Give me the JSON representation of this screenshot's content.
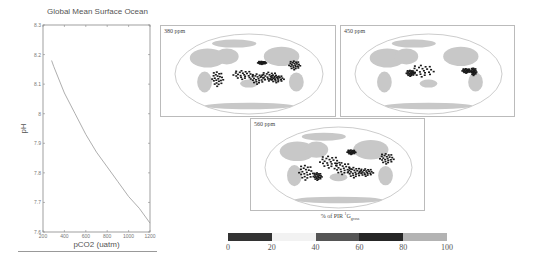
{
  "chart_data": [
    {
      "type": "line",
      "title": "Global Mean Surface Ocean",
      "xlabel": "pCO2 (uatm)",
      "ylabel": "pH",
      "xlim": [
        200,
        1200
      ],
      "ylim": [
        7.6,
        8.3
      ],
      "x_ticks": [
        200,
        400,
        600,
        800,
        1000,
        1200
      ],
      "y_ticks": [
        7.6,
        7.7,
        7.8,
        7.9,
        8,
        8.1,
        8.2,
        8.3
      ],
      "x_tick_labels": [
        "200",
        "400",
        "600",
        "800",
        "1000",
        "1200"
      ],
      "y_tick_labels": [
        "7.6",
        "7.7",
        "7.8",
        "7.9",
        "8",
        "8.1",
        "8.2",
        "8.3"
      ],
      "grid": false,
      "series": [
        {
          "name": "pH",
          "x": [
            280,
            300,
            400,
            500,
            600,
            700,
            800,
            900,
            1000,
            1100,
            1200
          ],
          "y": [
            8.18,
            8.16,
            8.07,
            8.0,
            7.93,
            7.87,
            7.82,
            7.77,
            7.72,
            7.68,
            7.63
          ]
        }
      ]
    },
    {
      "type": "heatmap",
      "title": "% of PIR 1G gross",
      "panels": [
        {
          "label": "380 ppm"
        },
        {
          "label": "450 ppm"
        },
        {
          "label": "560 ppm"
        }
      ],
      "colorbar": {
        "ticks": [
          0,
          20,
          40,
          60,
          80,
          100
        ],
        "bins": [
          {
            "range": [
              0,
              20
            ],
            "color": "#333333"
          },
          {
            "range": [
              20,
              40
            ],
            "color": "#f2f2f2"
          },
          {
            "range": [
              40,
              60
            ],
            "color": "#555555"
          },
          {
            "range": [
              60,
              80
            ],
            "color": "#262626"
          },
          {
            "range": [
              80,
              100
            ],
            "color": "#b3b3b3"
          }
        ]
      }
    }
  ],
  "ph_plot": {
    "title": "Global Mean Surface Ocean",
    "xlabel": "pCO2 (uatm)",
    "ylabel": "pH"
  },
  "maps": {
    "panels": [
      {
        "label": "380 ppm"
      },
      {
        "label": "450 ppm"
      },
      {
        "label": "560 ppm"
      }
    ],
    "caption_main": "% of PIR ",
    "caption_sup": "1",
    "caption_g": "G",
    "caption_sub": "gross",
    "colorbar_ticks": [
      "0",
      "20",
      "40",
      "60",
      "80",
      "100"
    ],
    "colors": {
      "land": "#c8c8c8",
      "hotspot": "#1a1a1a",
      "ocean": "#ffffff",
      "frame": "#bbbbbb"
    }
  }
}
